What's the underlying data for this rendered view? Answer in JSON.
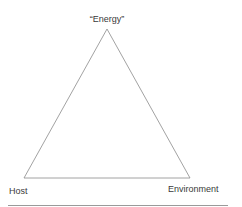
{
  "diagram": {
    "type": "triangle",
    "vertices": {
      "top": {
        "label": "“Energy”"
      },
      "bottom_left": {
        "label": "Host"
      },
      "bottom_right": {
        "label": "Environment"
      }
    },
    "colors": {
      "stroke": "#8a8a8a",
      "text": "#3a3a3a",
      "background": "#ffffff",
      "rule": "#9a9a9a"
    }
  }
}
